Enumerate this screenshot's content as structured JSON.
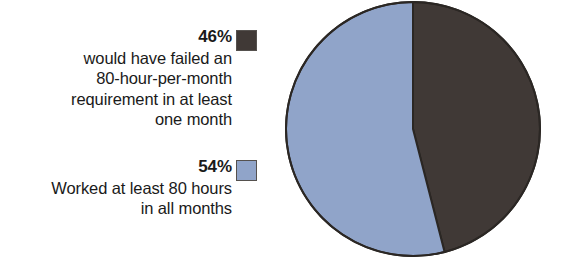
{
  "chart_data": {
    "type": "pie",
    "title": "",
    "subtitle": "",
    "xlabel": "",
    "ylabel": "",
    "grid": false,
    "legend_position": "left",
    "start_angle_deg": 0,
    "direction": "clockwise",
    "categories": [
      "would have failed an 80-hour-per-month requirement in at least one month",
      "Worked at least 80 hours in all months"
    ],
    "values": [
      46,
      54
    ],
    "value_unit": "%",
    "colors": [
      "#403936",
      "#90a4c9"
    ],
    "slices": [
      {
        "label": "would have failed an 80-hour-per-month requirement in at least one month",
        "value": 46,
        "display_value": "46%",
        "color": "#403936",
        "start_deg": 0,
        "end_deg": 165.6
      },
      {
        "label": "Worked at least 80 hours in all months",
        "value": 54,
        "display_value": "54%",
        "color": "#90a4c9",
        "start_deg": 165.6,
        "end_deg": 360
      }
    ]
  },
  "legend": {
    "entries": [
      {
        "percent": "46%",
        "swatch_color": "#403936",
        "swatch_icon": "dark-square-swatch-icon",
        "description_lines": [
          "would have failed an",
          "80-hour-per-month",
          "requirement in at least",
          "one month"
        ]
      },
      {
        "percent": "54%",
        "swatch_color": "#90a4c9",
        "swatch_icon": "light-blue-square-swatch-icon",
        "description_lines": [
          "Worked at least 80 hours",
          "in all months"
        ]
      }
    ]
  },
  "style": {
    "background": "#ffffff",
    "text_color": "#1a1a1a",
    "outline_color": "#2b2724"
  }
}
